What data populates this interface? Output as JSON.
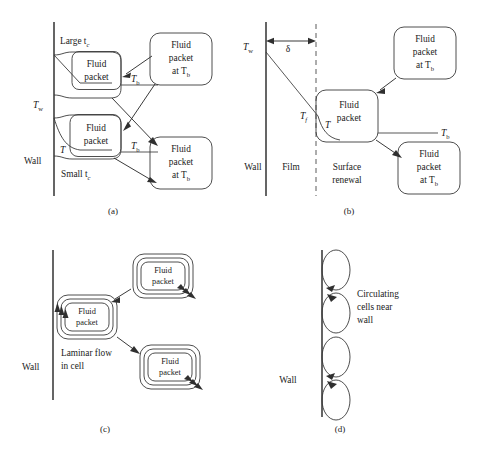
{
  "figure": {
    "background_color": "#ffffff",
    "line_color": "#3a3a3a",
    "panels": [
      {
        "id": "a",
        "caption": "(a)",
        "wall_label": "Wall",
        "wall_temperature_label": "T",
        "wall_temperature_sub": "w",
        "timescale_large": "Large t",
        "timescale_large_sub": "c",
        "timescale_small": "Small t",
        "timescale_small_sub": "c",
        "packet_line1": "Fluid",
        "packet_line2": "packet",
        "bulk_packet_line1": "Fluid",
        "bulk_packet_line2": "packet",
        "bulk_packet_line3_pre": "at T",
        "bulk_packet_line3_sub": "b",
        "temp_local": "T",
        "temp_bulk": "T",
        "temp_bulk_sub": "b"
      },
      {
        "id": "b",
        "caption": "(b)",
        "wall_label": "Wall",
        "film_label": "Film",
        "surface_renewal_line1": "Surface",
        "surface_renewal_line2": "renewal",
        "wall_temperature_label": "T",
        "wall_temperature_sub": "w",
        "film_thickness_symbol": "δ",
        "film_temperature_label": "T",
        "film_temperature_sub": "f",
        "temp_local": "T",
        "temp_bulk": "T",
        "temp_bulk_sub": "b",
        "packet_line1": "Fluid",
        "packet_line2": "packet",
        "bulk_packet_line1": "Fluid",
        "bulk_packet_line2": "packet",
        "bulk_packet_line3_pre": "at T",
        "bulk_packet_line3_sub": "b"
      },
      {
        "id": "c",
        "caption": "(c)",
        "wall_label": "Wall",
        "flow_line1": "Laminar flow",
        "flow_line2": "in cell",
        "packet_line1": "Fluid",
        "packet_line2": "packet"
      },
      {
        "id": "d",
        "caption": "(d)",
        "wall_label": "Wall",
        "cells_line1": "Circulating",
        "cells_line2": "cells near",
        "cells_line3": "wall"
      }
    ]
  }
}
